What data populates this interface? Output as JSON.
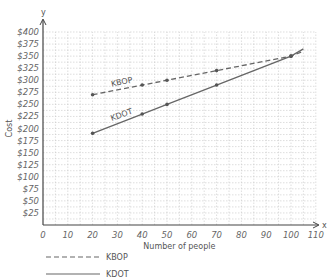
{
  "chart_data": {
    "type": "line",
    "title": "",
    "xlabel": "Number of people",
    "ylabel": "Cost",
    "x_axis_letter": "x",
    "y_axis_letter": "y",
    "xlim": [
      0,
      110
    ],
    "ylim": [
      0,
      400
    ],
    "grid": true,
    "legend_position": "bottom-left",
    "x_ticks": [
      "0",
      "10",
      "20",
      "30",
      "40",
      "50",
      "60",
      "70",
      "80",
      "90",
      "100",
      "110"
    ],
    "y_ticks": [
      "$25",
      "$50",
      "$75",
      "$100",
      "$125",
      "$150",
      "$175",
      "$200",
      "$225",
      "$250",
      "$275",
      "$300",
      "$325",
      "$350",
      "$375",
      "$400"
    ],
    "series": [
      {
        "name": "KBOP",
        "style": "dashed",
        "x": [
          20,
          40,
          50,
          70,
          100,
          105
        ],
        "y": [
          270,
          290,
          300,
          320,
          350,
          360
        ]
      },
      {
        "name": "KDOT",
        "style": "solid",
        "x": [
          20,
          40,
          50,
          70,
          100,
          105
        ],
        "y": [
          190,
          230,
          250,
          290,
          350,
          365
        ]
      }
    ],
    "annotations": [
      "KBOP",
      "KDOT"
    ]
  },
  "legend": [
    {
      "label": "KBOP",
      "style": "dashed"
    },
    {
      "label": "KDOT",
      "style": "solid"
    }
  ]
}
